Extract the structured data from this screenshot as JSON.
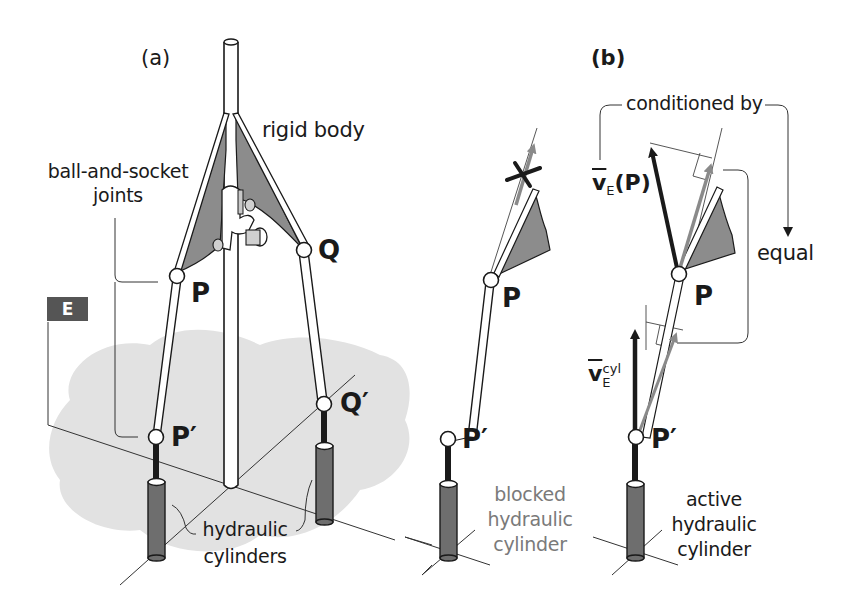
{
  "figure": {
    "panel_a": {
      "label": "(a)",
      "annotations": {
        "rigid_body": "rigid body",
        "joints_line1": "ball-and-socket",
        "joints_line2": "joints",
        "cylinders_line1": "hydraulic",
        "cylinders_line2": "cylinders",
        "frame_label": "E"
      },
      "points": {
        "P": "P",
        "Q": "Q",
        "P_prime": "P′",
        "Q_prime": "Q′"
      }
    },
    "panel_middle": {
      "points": {
        "P": "P",
        "P_prime": "P′"
      },
      "caption_line1": "blocked",
      "caption_line2": "hydraulic",
      "caption_line3": "cylinder"
    },
    "panel_b": {
      "label": "(b)",
      "conditioned_by": "conditioned by",
      "equal": "equal",
      "vector_P": {
        "symbol": "v",
        "subscript": "E",
        "argument": "(P)"
      },
      "vector_cyl": {
        "symbol": "v",
        "subscript": "E",
        "superscript": "cyl"
      },
      "points": {
        "P": "P",
        "P_prime": "P′"
      },
      "caption_line1": "active",
      "caption_line2": "hydraulic",
      "caption_line3": "cylinder"
    },
    "colors": {
      "rod_fill": "#ffffff",
      "stroke": "#1a1a1a",
      "shaded_body": "#8c8c8c",
      "ground_patch": "#e2e2e2",
      "cylinder": "#6e6e6e",
      "gray_arrow": "#8a8a8a",
      "e_box": "#555555"
    }
  }
}
